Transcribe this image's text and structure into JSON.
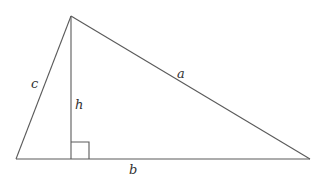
{
  "diagram": {
    "type": "triangle-with-altitude",
    "colors": {
      "line": "#5a5a5a",
      "label": "#333333",
      "background": "#ffffff"
    },
    "vertices": {
      "apex": [
        71,
        16
      ],
      "bottom_left": [
        16,
        159
      ],
      "bottom_right": [
        310,
        159
      ],
      "altitude_foot": [
        71,
        159
      ]
    },
    "right_angle_marker": {
      "x": 71,
      "y": 142,
      "size": 17
    },
    "labels": {
      "a": "a",
      "b": "b",
      "c": "c",
      "h": "h"
    }
  }
}
